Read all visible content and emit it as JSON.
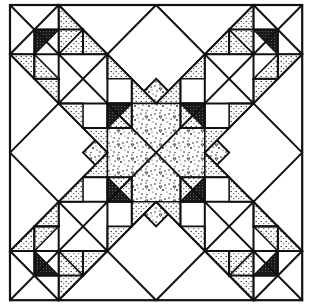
{
  "diagram": {
    "title": "",
    "type": "quilt-block-pattern",
    "grid_units": 6,
    "colors": {
      "line": "#111111",
      "background": "#ffffff",
      "dotted_fill": "#888888",
      "dark_fill": "#222222"
    },
    "elements": [
      {
        "name": "outer-square-border",
        "fill": "white"
      },
      {
        "name": "center-diamond",
        "fill": "speckled-confetti"
      },
      {
        "name": "corner-unit-top-left",
        "fill": "mixed"
      },
      {
        "name": "corner-unit-top-right",
        "fill": "mixed"
      },
      {
        "name": "corner-unit-bottom-left",
        "fill": "mixed"
      },
      {
        "name": "corner-unit-bottom-right",
        "fill": "mixed"
      },
      {
        "name": "x-band-diagonals",
        "fill": "white"
      }
    ]
  }
}
